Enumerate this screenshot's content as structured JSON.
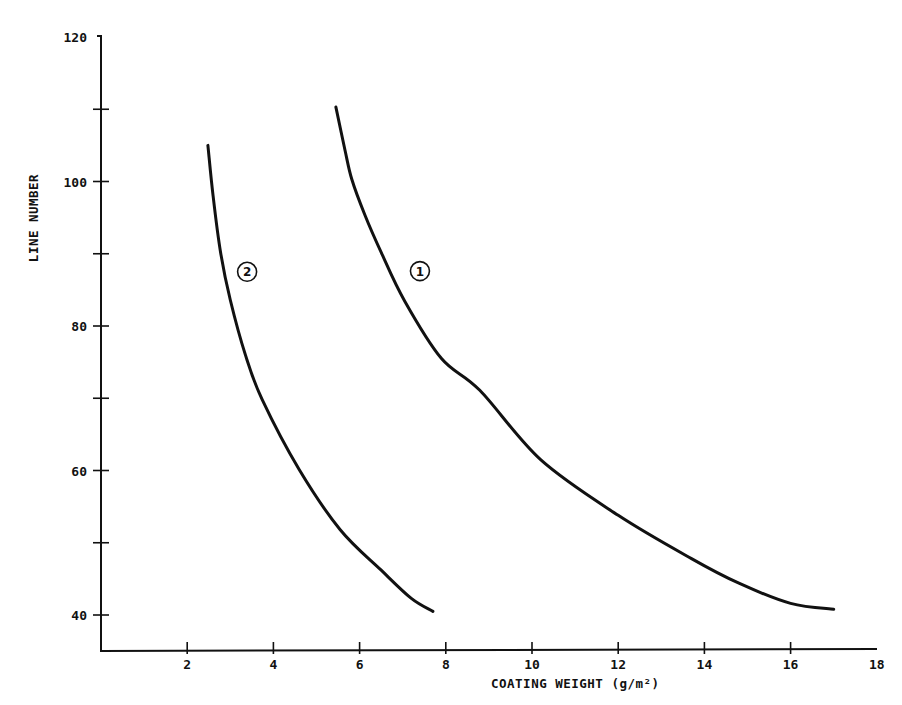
{
  "chart_data": {
    "type": "line",
    "title": "",
    "xlabel": "COATING WEIGHT (g/m²)",
    "ylabel": "LINE NUMBER",
    "xlim": [
      0,
      18
    ],
    "ylim": [
      35,
      120
    ],
    "x_ticks": [
      2,
      4,
      6,
      8,
      10,
      12,
      14,
      16,
      18
    ],
    "x_tick_labels": [
      "2",
      "4",
      "6",
      "8",
      "10",
      "12",
      "14",
      "16",
      "18"
    ],
    "y_ticks_major": [
      40,
      60,
      80,
      100,
      120
    ],
    "y_tick_labels": [
      "40",
      "60",
      "80",
      "100",
      "120"
    ],
    "y_ticks_minor": [
      50,
      70,
      90,
      110
    ],
    "grid": false,
    "legend": null,
    "series": [
      {
        "name": "1",
        "label_marker": "①",
        "label_position": {
          "x": 7.4,
          "y": 87.6
        },
        "points": [
          {
            "x": 5.45,
            "y": 110.3
          },
          {
            "x": 5.66,
            "y": 104.4
          },
          {
            "x": 5.82,
            "y": 100.3
          },
          {
            "x": 6.12,
            "y": 95.4
          },
          {
            "x": 6.5,
            "y": 90.2
          },
          {
            "x": 7.05,
            "y": 83.4
          },
          {
            "x": 7.9,
            "y": 75.5
          },
          {
            "x": 8.79,
            "y": 71.1
          },
          {
            "x": 10.2,
            "y": 61.5
          },
          {
            "x": 12.0,
            "y": 53.8
          },
          {
            "x": 13.7,
            "y": 47.8
          },
          {
            "x": 14.8,
            "y": 44.4
          },
          {
            "x": 16.0,
            "y": 41.6
          },
          {
            "x": 17.0,
            "y": 40.8
          }
        ]
      },
      {
        "name": "2",
        "label_marker": "②",
        "label_position": {
          "x": 3.39,
          "y": 87.5
        },
        "points": [
          {
            "x": 2.48,
            "y": 105.0
          },
          {
            "x": 2.6,
            "y": 98.0
          },
          {
            "x": 2.78,
            "y": 90.0
          },
          {
            "x": 3.0,
            "y": 83.6
          },
          {
            "x": 3.35,
            "y": 76.0
          },
          {
            "x": 3.74,
            "y": 69.8
          },
          {
            "x": 4.6,
            "y": 60.1
          },
          {
            "x": 5.55,
            "y": 51.8
          },
          {
            "x": 6.5,
            "y": 46.2
          },
          {
            "x": 7.2,
            "y": 42.3
          },
          {
            "x": 7.7,
            "y": 40.5
          }
        ]
      }
    ]
  },
  "labels": {
    "xlabel": "COATING WEIGHT (g/m²)",
    "ylabel": "LINE NUMBER",
    "curve1_marker": "1",
    "curve2_marker": "2"
  },
  "colors": {
    "ink": "#111111",
    "background": "#ffffff"
  }
}
